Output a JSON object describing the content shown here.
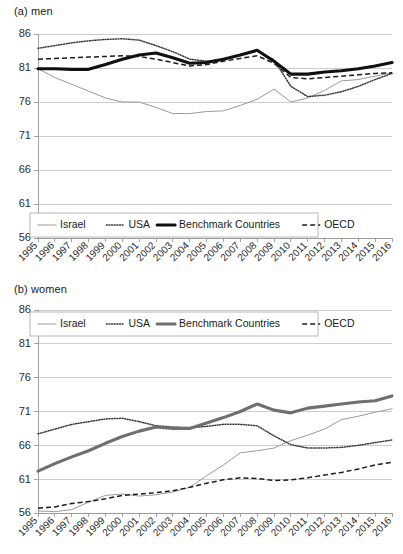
{
  "figure": {
    "panels": [
      {
        "id": "a",
        "title": "(a) men"
      },
      {
        "id": "b",
        "title": "(b) women"
      }
    ]
  },
  "chart_data": [
    {
      "type": "line",
      "title": "(a) men",
      "xlabel": "",
      "ylabel": "",
      "ylim": [
        56,
        86
      ],
      "yticks": [
        56,
        61,
        66,
        71,
        76,
        81,
        86
      ],
      "grid": true,
      "legend_position": "bottom-left",
      "x": [
        1995,
        1996,
        1997,
        1998,
        1999,
        2000,
        2001,
        2002,
        2003,
        2004,
        2005,
        2006,
        2007,
        2008,
        2009,
        2010,
        2011,
        2012,
        2013,
        2014,
        2015,
        2016
      ],
      "series": [
        {
          "name": "Israel",
          "style": "thin-solid",
          "color": "#9a9a9a",
          "values": [
            80.9,
            79.6,
            78.6,
            77.6,
            76.6,
            76.0,
            76.0,
            75.2,
            74.3,
            74.3,
            74.6,
            74.7,
            75.5,
            76.4,
            77.9,
            76.0,
            76.6,
            77.7,
            79.1,
            79.3,
            79.8,
            80.3
          ]
        },
        {
          "name": "USA",
          "style": "dotted",
          "color": "#3a3a3a",
          "values": [
            83.9,
            84.3,
            84.7,
            85.0,
            85.2,
            85.3,
            85.1,
            84.3,
            83.4,
            82.3,
            82.0,
            82.3,
            82.9,
            83.5,
            82.2,
            78.3,
            76.8,
            77.0,
            77.5,
            78.3,
            79.3,
            80.2
          ]
        },
        {
          "name": "Benchmark Countries",
          "style": "thick-solid",
          "color": "#101010",
          "values": [
            80.9,
            80.9,
            80.8,
            80.8,
            81.5,
            82.3,
            82.9,
            83.2,
            82.5,
            81.7,
            81.8,
            82.3,
            82.9,
            83.6,
            82.0,
            80.1,
            80.1,
            80.4,
            80.6,
            80.9,
            81.3,
            81.8
          ]
        },
        {
          "name": "OECD",
          "style": "dashed",
          "color": "#1c1c1c",
          "values": [
            82.3,
            82.4,
            82.5,
            82.6,
            82.7,
            82.8,
            82.7,
            82.3,
            81.8,
            81.3,
            81.5,
            82.0,
            82.4,
            82.8,
            81.7,
            79.6,
            79.4,
            79.6,
            79.8,
            80.0,
            80.2,
            80.3
          ]
        }
      ]
    },
    {
      "type": "line",
      "title": "(b) women",
      "xlabel": "",
      "ylabel": "",
      "ylim": [
        56,
        86
      ],
      "yticks": [
        56,
        61,
        66,
        71,
        76,
        81,
        86
      ],
      "grid": true,
      "legend_position": "top",
      "x": [
        1995,
        1996,
        1997,
        1998,
        1999,
        2000,
        2001,
        2002,
        2003,
        2004,
        2005,
        2006,
        2007,
        2008,
        2009,
        2010,
        2011,
        2012,
        2013,
        2014,
        2015,
        2016
      ],
      "series": [
        {
          "name": "Israel",
          "style": "thin-solid",
          "color": "#9a9a9a",
          "values": [
            56.3,
            56.2,
            56.5,
            57.6,
            58.6,
            58.8,
            58.5,
            58.7,
            59.1,
            59.8,
            61.5,
            63.1,
            64.9,
            65.2,
            65.6,
            66.7,
            67.5,
            68.4,
            69.8,
            70.3,
            70.9,
            71.4
          ]
        },
        {
          "name": "USA",
          "style": "dotted",
          "color": "#3a3a3a",
          "values": [
            67.7,
            68.4,
            69.1,
            69.5,
            69.9,
            70.0,
            69.5,
            68.9,
            68.7,
            68.6,
            68.8,
            69.1,
            69.1,
            68.9,
            67.4,
            66.1,
            65.6,
            65.6,
            65.7,
            66.0,
            66.4,
            66.8
          ]
        },
        {
          "name": "Benchmark Countries",
          "style": "thick-solid-gray",
          "color": "#6f6f6f",
          "values": [
            62.2,
            63.3,
            64.3,
            65.2,
            66.3,
            67.3,
            68.1,
            68.7,
            68.5,
            68.5,
            69.3,
            70.1,
            71.0,
            72.1,
            71.2,
            70.8,
            71.5,
            71.8,
            72.1,
            72.4,
            72.6,
            73.3
          ]
        },
        {
          "name": "OECD",
          "style": "dashed",
          "color": "#1c1c1c",
          "values": [
            56.7,
            56.9,
            57.4,
            57.7,
            58.1,
            58.6,
            58.8,
            59.0,
            59.3,
            59.8,
            60.4,
            60.9,
            61.2,
            61.1,
            60.8,
            60.9,
            61.2,
            61.6,
            62.0,
            62.5,
            63.1,
            63.5
          ]
        }
      ]
    }
  ],
  "legend": {
    "items": [
      {
        "label": "Israel",
        "style": "thin-solid"
      },
      {
        "label": "USA",
        "style": "dotted"
      },
      {
        "label": "Benchmark Countries",
        "style": "thick-solid"
      },
      {
        "label": "OECD",
        "style": "dashed"
      }
    ]
  }
}
